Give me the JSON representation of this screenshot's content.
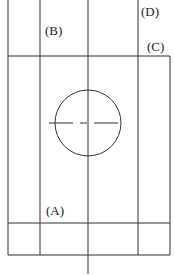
{
  "diagram": {
    "labels": {
      "a": "(A)",
      "b": "(B)",
      "c": "(C)",
      "d": "(D)"
    },
    "line_color": "#333333"
  }
}
